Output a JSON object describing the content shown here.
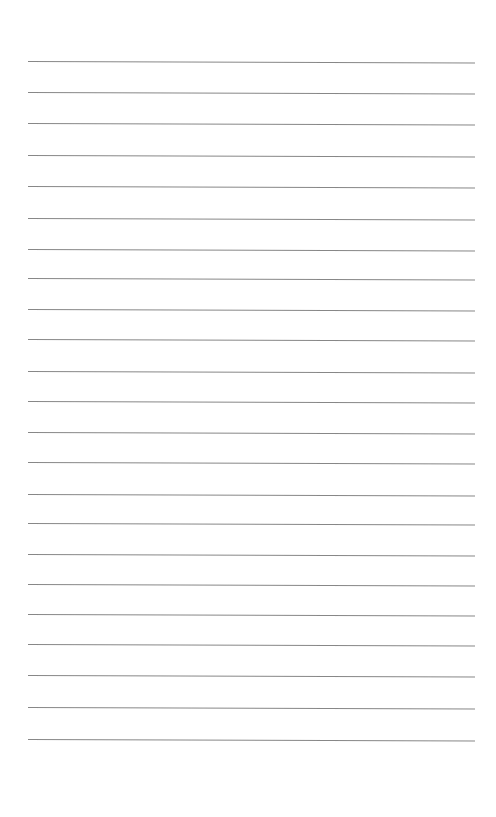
{
  "document": {
    "type": "lined-paper",
    "line_count": 23,
    "line_color": "#7a7a7a",
    "background_color": "#ffffff",
    "lines_y": [
      61,
      92,
      123,
      155,
      186,
      218,
      249,
      278,
      309,
      339,
      371,
      401,
      432,
      462,
      494,
      523,
      554,
      584,
      614,
      644,
      675,
      707,
      739
    ],
    "text": []
  }
}
